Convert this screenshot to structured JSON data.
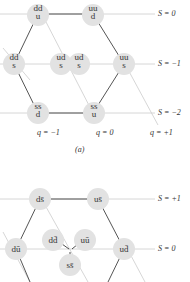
{
  "diagram_a": {
    "caption": "(a)",
    "strangeness_labels": [
      "S = 0",
      "S = −1",
      "S = −2"
    ],
    "charge_labels": [
      "q = −1",
      "q = 0",
      "q = +1"
    ],
    "nodes": [
      {
        "top": "dd",
        "bottom": "u"
      },
      {
        "top": "uu",
        "bottom": "d"
      },
      {
        "top": "dd",
        "bottom": "s"
      },
      {
        "top": "ud",
        "bottom": "s"
      },
      {
        "top": "ud",
        "bottom": "s"
      },
      {
        "top": "uu",
        "bottom": "s"
      },
      {
        "top": "ss",
        "bottom": "d"
      },
      {
        "top": "ss",
        "bottom": "u"
      }
    ]
  },
  "diagram_b": {
    "strangeness_labels": [
      "S = +1",
      "S = 0"
    ],
    "nodes": [
      "ds̄",
      "us̄",
      "dū",
      "dd̄",
      "uū",
      "ud̄",
      "ss̄"
    ]
  }
}
